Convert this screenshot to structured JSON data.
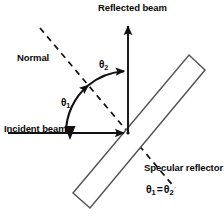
{
  "figure": {
    "background_color": "#ffffff",
    "stroke_color": "#111111",
    "width": 224,
    "height": 218
  },
  "labels": {
    "reflected_beam": "Reflected beam",
    "normal": "Normal",
    "incident_beam": "Incident beam",
    "specular_reflector": "Specular reflector",
    "theta_symbol": "θ",
    "theta1_sub": "1",
    "theta2_sub": "2",
    "equals": "=",
    "equation": "θ1 = θ2"
  },
  "elements": [
    {
      "name": "incident-beam-ray",
      "type": "arrow",
      "from": [
        8,
        133
      ],
      "to": [
        128,
        133
      ],
      "style": "solid",
      "description": "Horizontal incoming beam travelling left to right toward the reflector"
    },
    {
      "name": "reflected-beam-ray",
      "type": "arrow",
      "from": [
        128,
        133
      ],
      "to": [
        128,
        22
      ],
      "style": "solid",
      "description": "Vertical outgoing beam travelling upward from the point of incidence"
    },
    {
      "name": "normal-line",
      "type": "line",
      "from": [
        40,
        28
      ],
      "to": [
        175,
        188
      ],
      "style": "dashed",
      "description": "Surface normal drawn through the point of incidence, perpendicular to the reflector"
    },
    {
      "name": "specular-reflector-surface",
      "type": "rectangle",
      "corners": [
        [
          73,
          193
        ],
        [
          189,
          55
        ],
        [
          205,
          70
        ],
        [
          90,
          208
        ]
      ],
      "style": "solid",
      "description": "Long thin mirror slab inclined at about 45 degrees"
    },
    {
      "name": "angle-arc-theta1",
      "type": "arc",
      "center": [
        128,
        133
      ],
      "radius": 62,
      "start_angle_deg": 180,
      "end_angle_deg": 130,
      "description": "Angle of incidence measured from the incident beam to the normal"
    },
    {
      "name": "angle-arc-theta2",
      "type": "arc",
      "center": [
        128,
        133
      ],
      "radius": 62,
      "start_angle_deg": 130,
      "end_angle_deg": 90,
      "description": "Angle of reflection measured from the normal to the reflected beam"
    },
    {
      "name": "point-of-incidence",
      "type": "point",
      "at": [
        128,
        133
      ],
      "description": "Vertex where incident beam, reflected beam, normal and reflector meet"
    }
  ],
  "annotations": {
    "relationship": "θ1 = θ2",
    "meaning": "The angle of incidence equals the angle of reflection"
  }
}
